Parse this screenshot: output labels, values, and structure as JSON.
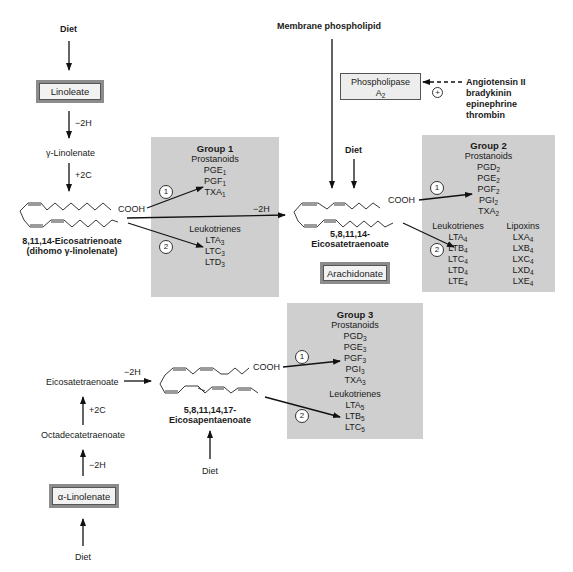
{
  "top_left": {
    "diet": "Diet",
    "linoleate": "Linoleate",
    "step1": "−2H",
    "gamma_linolenate": "γ-Linolenate",
    "step2": "+2C",
    "compound_name_line1": "8,11,14-Eicosatrienoate",
    "compound_name_line2": "(dihomo γ-linolenate)",
    "cooh": "COOH"
  },
  "center_top": {
    "membrane": "Membrane phospholipid",
    "phospholipase_line1": "Phospholipase",
    "phospholipase_line2": "A",
    "phospholipase_sub": "2",
    "plus_symbol": "+",
    "activators": [
      "Angiotensin II",
      "bradykinin",
      "epinephrine",
      "thrombin"
    ],
    "diet": "Diet",
    "conversion": "−2H",
    "compound_name_line1": "5,8,11,14-",
    "compound_name_line2": "Eicosatetraenoate",
    "arachidonate": "Arachidonate",
    "cooh": "COOH"
  },
  "group1": {
    "title": "Group 1",
    "prostanoids_label": "Prostanoids",
    "prostanoids": [
      {
        "n": "PGE",
        "s": "1"
      },
      {
        "n": "PGF",
        "s": "1"
      },
      {
        "n": "TXA",
        "s": "1"
      }
    ],
    "leukotrienes_label": "Leukotrienes",
    "leukotrienes": [
      {
        "n": "LTA",
        "s": "3"
      },
      {
        "n": "LTC",
        "s": "3"
      },
      {
        "n": "LTD",
        "s": "3"
      }
    ],
    "path1": "1",
    "path2": "2"
  },
  "group2": {
    "title": "Group 2",
    "prostanoids_label": "Prostanoids",
    "prostanoids": [
      {
        "n": "PGD",
        "s": "2"
      },
      {
        "n": "PGE",
        "s": "2"
      },
      {
        "n": "PGF",
        "s": "2"
      },
      {
        "n": "PGI",
        "s": "2"
      },
      {
        "n": "TXA",
        "s": "2"
      }
    ],
    "leukotrienes_label": "Leukotrienes",
    "leukotrienes": [
      {
        "n": "LTA",
        "s": "4"
      },
      {
        "n": "LTB",
        "s": "4"
      },
      {
        "n": "LTC",
        "s": "4"
      },
      {
        "n": "LTD",
        "s": "4"
      },
      {
        "n": "LTE",
        "s": "4"
      }
    ],
    "lipoxins_label": "Lipoxins",
    "lipoxins": [
      {
        "n": "LXA",
        "s": "4"
      },
      {
        "n": "LXB",
        "s": "4"
      },
      {
        "n": "LXC",
        "s": "4"
      },
      {
        "n": "LXD",
        "s": "4"
      },
      {
        "n": "LXE",
        "s": "4"
      }
    ],
    "path1": "1",
    "path2": "2"
  },
  "group3": {
    "title": "Group 3",
    "prostanoids_label": "Prostanoids",
    "prostanoids": [
      {
        "n": "PGD",
        "s": "3"
      },
      {
        "n": "PGE",
        "s": "3"
      },
      {
        "n": "PGF",
        "s": "3"
      },
      {
        "n": "PGI",
        "s": "3"
      },
      {
        "n": "TXA",
        "s": "3"
      }
    ],
    "leukotrienes_label": "Leukotrienes",
    "leukotrienes": [
      {
        "n": "LTA",
        "s": "5"
      },
      {
        "n": "LTB",
        "s": "5"
      },
      {
        "n": "LTC",
        "s": "5"
      }
    ],
    "path1": "1",
    "path2": "2"
  },
  "bottom_left": {
    "eicosatetraenoate": "Eicosatetraenoate",
    "step_minus2h_a": "−2H",
    "step_plus2c": "+2C",
    "octadecatetraenoate": "Octadecatetraenoate",
    "step_minus2h_b": "−2H",
    "alpha_linolenate": "α-Linolenate",
    "diet": "Diet",
    "compound_name_line1": "5,8,11,14,17-",
    "compound_name_line2": "Eicosapentaenoate",
    "diet2": "Diet",
    "cooh": "COOH"
  }
}
